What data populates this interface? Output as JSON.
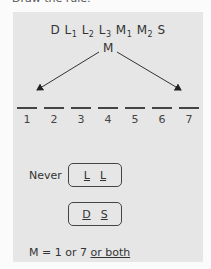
{
  "title": "Draw the rule:",
  "sequence": [
    {
      "base": "D",
      "sub": ""
    },
    {
      "base": "L",
      "sub": "1"
    },
    {
      "base": "L",
      "sub": "2"
    },
    {
      "base": "L",
      "sub": "3"
    },
    {
      "base": "M",
      "sub": "1"
    },
    {
      "base": "M",
      "sub": "2"
    },
    {
      "base": "S",
      "sub": ""
    }
  ],
  "m_label": "M",
  "slots": [
    "1",
    "2",
    "3",
    "4",
    "5",
    "6",
    "7"
  ],
  "never_label": "Never",
  "box1": [
    "L",
    "L"
  ],
  "box2": [
    "D",
    "S"
  ],
  "m_rule": {
    "prefix": "M = 1 or 7 ",
    "underlined": "or both"
  },
  "colors": {
    "panel": "#e6e6e6",
    "ink": "#333333",
    "background": "#fbfbfb"
  }
}
